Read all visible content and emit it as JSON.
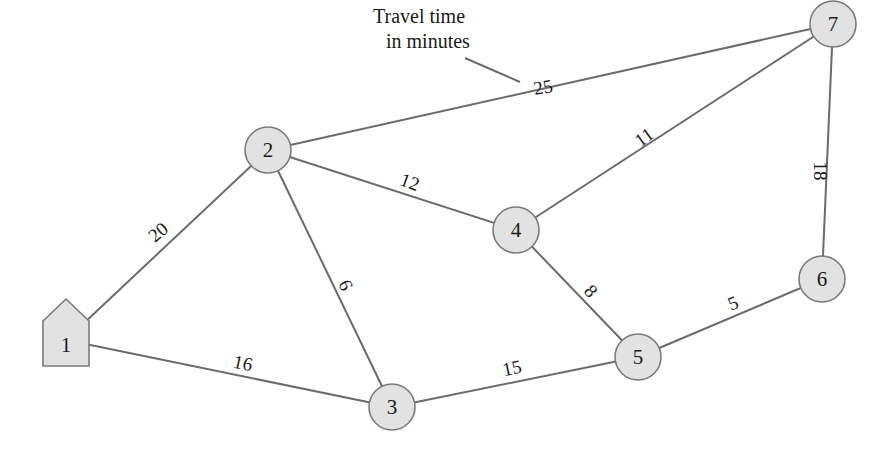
{
  "annotation": {
    "line1": "Travel time",
    "line2": "in minutes",
    "pointer_from": [
      465,
      58
    ],
    "pointer_to": [
      520,
      82
    ]
  },
  "nodes": [
    {
      "id": "1",
      "label": "1",
      "shape": "house",
      "x": 66,
      "y": 340
    },
    {
      "id": "2",
      "label": "2",
      "shape": "circle",
      "x": 268,
      "y": 150
    },
    {
      "id": "3",
      "label": "3",
      "shape": "circle",
      "x": 392,
      "y": 407
    },
    {
      "id": "4",
      "label": "4",
      "shape": "circle",
      "x": 516,
      "y": 230
    },
    {
      "id": "5",
      "label": "5",
      "shape": "circle",
      "x": 638,
      "y": 357
    },
    {
      "id": "6",
      "label": "6",
      "shape": "circle",
      "x": 822,
      "y": 279
    },
    {
      "id": "7",
      "label": "7",
      "shape": "circle",
      "x": 833,
      "y": 24
    }
  ],
  "edges": [
    {
      "from": "1",
      "to": "2",
      "weight": "20",
      "lx": 158,
      "ly": 232,
      "rot": -40
    },
    {
      "from": "1",
      "to": "3",
      "weight": "16",
      "lx": 243,
      "ly": 363,
      "rot": 12
    },
    {
      "from": "2",
      "to": "3",
      "weight": "6",
      "lx": 346,
      "ly": 285,
      "rot": 65
    },
    {
      "from": "2",
      "to": "4",
      "weight": "12",
      "lx": 410,
      "ly": 182,
      "rot": 20
    },
    {
      "from": "2",
      "to": "7",
      "weight": "25",
      "lx": 543,
      "ly": 87,
      "rot": -10
    },
    {
      "from": "4",
      "to": "7",
      "weight": "11",
      "lx": 644,
      "ly": 137,
      "rot": -36
    },
    {
      "from": "4",
      "to": "5",
      "weight": "8",
      "lx": 591,
      "ly": 291,
      "rot": 48
    },
    {
      "from": "3",
      "to": "5",
      "weight": "15",
      "lx": 512,
      "ly": 368,
      "rot": -12
    },
    {
      "from": "5",
      "to": "6",
      "weight": "5",
      "lx": 733,
      "ly": 303,
      "rot": -22
    },
    {
      "from": "7",
      "to": "6",
      "weight": "18",
      "lx": 820,
      "ly": 171,
      "rot": 90
    }
  ],
  "style": {
    "node_fill": "#e2e2e2",
    "node_stroke": "#7a7a7a",
    "edge_color": "#6b6b6b",
    "text_color": "#1a1a1a"
  }
}
